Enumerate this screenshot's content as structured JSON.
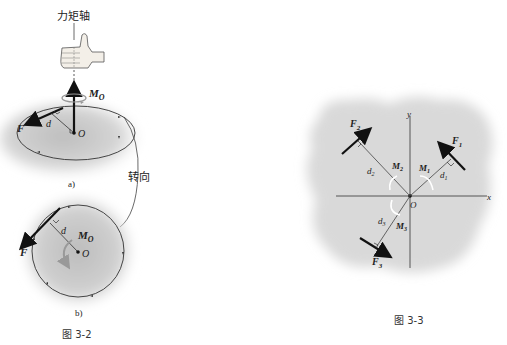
{
  "figure_3_2": {
    "caption": "图 3-2",
    "axis_label": "力矩轴",
    "rotation_label": "转向",
    "sub_a": "a)",
    "sub_b": "b)",
    "force": "F",
    "moment": "M",
    "moment_sub": "O",
    "origin": "O",
    "distance": "d"
  },
  "figure_3_3": {
    "caption": "图 3-3",
    "axis_x": "x",
    "axis_y": "y",
    "origin": "O",
    "forces": [
      {
        "label": "F",
        "sub": "1",
        "moment": "M",
        "moment_sub": "1",
        "distance": "d",
        "distance_sub": "1"
      },
      {
        "label": "F",
        "sub": "2",
        "moment": "M",
        "moment_sub": "2",
        "distance": "d",
        "distance_sub": "2"
      },
      {
        "label": "F",
        "sub": "3",
        "moment": "M",
        "moment_sub": "3",
        "distance": "d",
        "distance_sub": "3"
      }
    ]
  }
}
